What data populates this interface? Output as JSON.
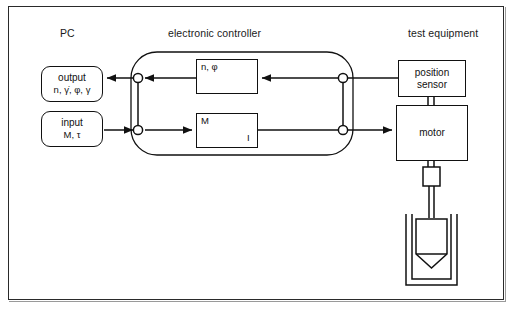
{
  "figure": {
    "kind": "block-diagram"
  },
  "zones": {
    "pc": "PC",
    "controller": "electronic controller",
    "test_equipment": "test equipment"
  },
  "pc_blocks": [
    {
      "id": "output",
      "title": "output",
      "variables": "n, γ̇, φ, γ",
      "direction": "from controller to PC"
    },
    {
      "id": "input",
      "title": "input",
      "variables": "M, τ",
      "direction": "from PC to controller"
    }
  ],
  "controller_blocks": [
    {
      "id": "speed-angle-converter",
      "label": "n, φ",
      "glyph": "pulse-train",
      "note": "diagonal transfer line with square-wave pulse symbol"
    },
    {
      "id": "torque-current-converter",
      "label_in": "M",
      "label_out": "I",
      "glyph": "diagonal-ramp",
      "note": "diagonal transfer line, torque to current"
    }
  ],
  "test_blocks": [
    {
      "id": "position-sensor",
      "label": "position\nsensor"
    },
    {
      "id": "motor",
      "label": "motor"
    }
  ],
  "test_blocks_text": {
    "position_sensor": "position sensor",
    "motor": "motor"
  },
  "mechanical_assembly": {
    "coupling": "shaft coupling",
    "shaft": "drive shaft",
    "rotor": "measuring bob (cone-bottom cylinder)",
    "cup": "sample cup"
  },
  "nodes": [
    {
      "id": "node-left-top",
      "role": "output signal junction"
    },
    {
      "id": "node-left-bot",
      "role": "input signal junction"
    },
    {
      "id": "node-right-top",
      "role": "sensor feedback junction"
    },
    {
      "id": "node-right-bot",
      "role": "drive current junction"
    }
  ],
  "colors": {
    "line": "#111111",
    "frame": "#2a2a2a",
    "background": "#ffffff",
    "shadow": "#9a9a9a"
  }
}
